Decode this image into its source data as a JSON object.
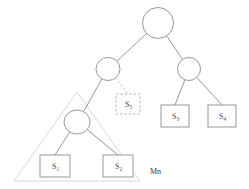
{
  "figure": {
    "title": "",
    "background_color": "#ffffff",
    "stroke_color": "#8d8d8d",
    "dashed_stroke_color": "#a8a8a8",
    "triangle_color": "#d8d8d8",
    "label_color": "#4a4a4a"
  },
  "nodes": {
    "root": {
      "name": "root-node",
      "label": "",
      "cx": 158,
      "cy": 23,
      "rx": 15.5,
      "ry": 15.5
    },
    "left_internal": {
      "name": "left-internal-node",
      "label": "",
      "cx": 108,
      "cy": 69,
      "rx": 12.0,
      "ry": 11.5
    },
    "right_internal": {
      "name": "right-internal-node",
      "label": "",
      "cx": 189,
      "cy": 69,
      "rx": 11.5,
      "ry": 11.5
    },
    "lower_left_internal": {
      "name": "lower-left-internal-node",
      "label": "",
      "cx": 77,
      "cy": 122,
      "rx": 13.0,
      "ry": 12.0
    }
  },
  "leaves": [
    {
      "id": "s1",
      "label_main": "S",
      "label_sub": "1",
      "x": 40,
      "y": 155,
      "width": 30,
      "height": 22,
      "style": "solid"
    },
    {
      "id": "s2",
      "label_main": "S",
      "label_sub": "2",
      "x": 103,
      "y": 155,
      "width": 30,
      "height": 22,
      "style": "solid"
    },
    {
      "id": "s3",
      "label_main": "S",
      "label_sub": "3",
      "x": 161,
      "y": 105,
      "width": 28,
      "height": 22,
      "style": "solid"
    },
    {
      "id": "s4",
      "label_main": "S",
      "label_sub": "4",
      "x": 208,
      "y": 105,
      "width": 28,
      "height": 22,
      "style": "solid"
    },
    {
      "id": "s5",
      "label_main": "S",
      "label_sub": "5",
      "x": 116,
      "y": 94,
      "width": 24,
      "height": 20,
      "style": "dashed"
    }
  ],
  "edges": [
    {
      "id": "root-to-left",
      "from": "root",
      "to": "left_internal",
      "style": "solid"
    },
    {
      "id": "root-to-right",
      "from": "root",
      "to": "right_internal",
      "style": "solid"
    },
    {
      "id": "left-to-lower-left",
      "from": "left_internal",
      "to": "lower_left_internal",
      "style": "solid"
    },
    {
      "id": "left-to-s5",
      "from": "left_internal",
      "to": "s5",
      "style": "dashed"
    },
    {
      "id": "lower-left-to-s1",
      "from": "lower_left_internal",
      "to": "s1",
      "style": "solid"
    },
    {
      "id": "lower-left-to-s2",
      "from": "lower_left_internal",
      "to": "s2",
      "style": "solid"
    },
    {
      "id": "right-to-s3",
      "from": "right_internal",
      "to": "s3",
      "style": "solid"
    },
    {
      "id": "right-to-s4",
      "from": "right_internal",
      "to": "s4",
      "style": "solid"
    }
  ],
  "group_region": {
    "name": "subtree-group-triangle",
    "apex_x": 77,
    "apex_y": 92,
    "base_left_x": 14,
    "base_right_x": 140,
    "base_y": 181,
    "label": "Mn",
    "label_x": 150,
    "label_y": 174
  }
}
